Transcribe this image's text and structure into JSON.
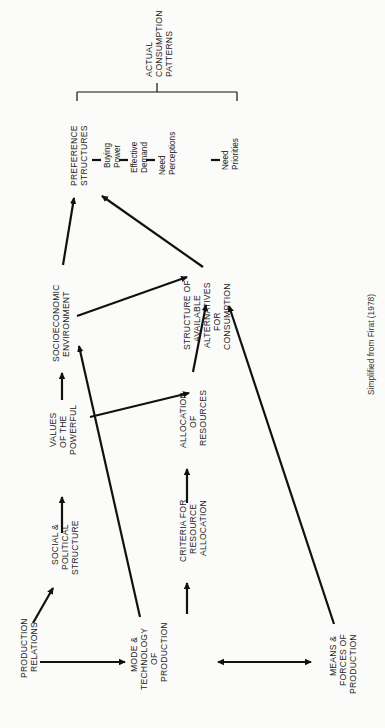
{
  "diagram": {
    "orientation": "rotated 90deg counter-clockwise",
    "nodes": {
      "production_relations": [
        "PRODUCTION",
        "RELATIONS"
      ],
      "social_political": [
        "SOCIAL &",
        "POLITICAL",
        "STRUCTURE"
      ],
      "values_powerful": [
        "VALUES",
        "OF THE",
        "POWERFUL"
      ],
      "socioeconomic": [
        "SOCIOECONOMIC",
        "ENVIRONMENT"
      ],
      "preference": [
        "PREFERENCE",
        "STRUCTURES"
      ],
      "mode_technology": [
        "MODE &",
        "TECHNOLOGY",
        "OF",
        "PRODUCTION"
      ],
      "criteria": [
        "CRITERIA FOR",
        "RESOURCE",
        "ALLOCATION"
      ],
      "allocation": [
        "ALLOCATION",
        "OF",
        "RESOURCES"
      ],
      "structure_alternatives": [
        "STRUCTURE OF",
        "AVAILABLE",
        "ALTERNATIVES",
        "FOR",
        "CONSUMPTION"
      ],
      "means_forces": [
        "MEANS &",
        "FORCES OF",
        "PRODUCTION"
      ],
      "actual_consumption": [
        "ACTUAL",
        "CONSUMPTION",
        "PATTERNS"
      ]
    },
    "preference_chain": [
      [
        "Buying",
        "Power"
      ],
      [
        "Effective",
        "Demand"
      ],
      [
        "Need",
        "Perceptions"
      ],
      [
        "Need",
        "Priorities"
      ]
    ],
    "edges": [
      {
        "from": "production_relations",
        "to": "social_political"
      },
      {
        "from": "production_relations",
        "to": "mode_technology"
      },
      {
        "from": "social_political",
        "to": "values_powerful"
      },
      {
        "from": "values_powerful",
        "to": "socioeconomic"
      },
      {
        "from": "values_powerful",
        "to": "allocation"
      },
      {
        "from": "socioeconomic",
        "to": "preference"
      },
      {
        "from": "socioeconomic",
        "to": "structure_alternatives"
      },
      {
        "from": "mode_technology",
        "to": "socioeconomic"
      },
      {
        "from": "mode_technology",
        "to": "criteria"
      },
      {
        "from": "mode_technology",
        "to": "means_forces",
        "bidirectional": true
      },
      {
        "from": "criteria",
        "to": "allocation"
      },
      {
        "from": "allocation",
        "to": "structure_alternatives"
      },
      {
        "from": "structure_alternatives",
        "to": "preference"
      },
      {
        "from": "means_forces",
        "to": "structure_alternatives"
      }
    ],
    "caption": "Simplified from Firat (1978)"
  }
}
